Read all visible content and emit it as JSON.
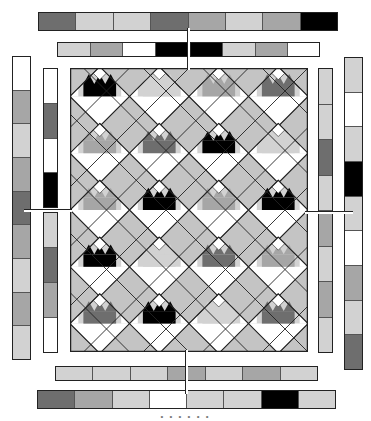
{
  "colors": {
    "white": "#ffffff",
    "light": "#d2d2d2",
    "mid": "#a6a6a6",
    "dark": "#6e6e6e",
    "black": "#000000",
    "background": "#c4c4c4",
    "outline": "#222222"
  },
  "strips": {
    "top_outer": [
      "dark",
      "light",
      "light",
      "dark",
      "mid",
      "light",
      "mid",
      "black"
    ],
    "top_inner_left": [
      "light",
      "mid",
      "white",
      "black"
    ],
    "top_inner_right": [
      "black",
      "light",
      "mid",
      "white"
    ],
    "left_outer": [
      "white",
      "mid",
      "light",
      "mid",
      "dark",
      "mid",
      "light",
      "mid",
      "light"
    ],
    "left_inner_top": [
      "white",
      "dark",
      "white",
      "black"
    ],
    "left_inner_bottom": [
      "light",
      "dark",
      "mid",
      "white"
    ],
    "right_inner": [
      "light",
      "light",
      "dark",
      "light",
      "mid",
      "light",
      "mid",
      "light"
    ],
    "right_outer": [
      "light",
      "white",
      "light",
      "black",
      "light",
      "white",
      "mid",
      "light",
      "dark"
    ],
    "bottom_inner": [
      "light",
      "light",
      "light",
      "mid",
      "light",
      "mid",
      "light"
    ],
    "bottom_outer": [
      "dark",
      "mid",
      "light",
      "white",
      "light",
      "light",
      "black",
      "light"
    ]
  },
  "quilt": {
    "cols": 4,
    "rows": 5,
    "blocks": [
      [
        "black",
        "light",
        "mid",
        "dark"
      ],
      [
        "mid",
        "dark",
        "black",
        "light"
      ],
      [
        "mid",
        "black",
        "mid",
        "black"
      ],
      [
        "black",
        "light",
        "dark",
        "mid"
      ],
      [
        "dark",
        "black",
        "light",
        "dark"
      ]
    ]
  },
  "caption": "• • • • • •"
}
